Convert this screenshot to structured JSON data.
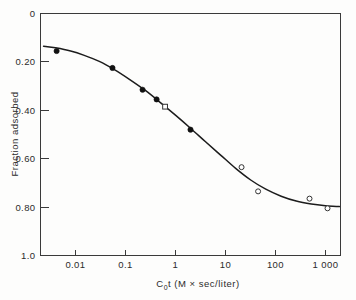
{
  "chart_data": {
    "type": "line",
    "title": "",
    "xlabel": "C₀t (M × sec/liter)",
    "ylabel": "Fraction adsorbed",
    "xscale": "log",
    "yscale": "linear",
    "xlim": [
      0.002,
      2000
    ],
    "ylim": [
      0,
      1.0
    ],
    "y_inverted": true,
    "grid": false,
    "legend": "none",
    "xticks": [
      {
        "value": 0.01,
        "label": "0.01"
      },
      {
        "value": 0.1,
        "label": "0.1"
      },
      {
        "value": 1,
        "label": "1"
      },
      {
        "value": 10,
        "label": "10"
      },
      {
        "value": 100,
        "label": "100"
      },
      {
        "value": 1000,
        "label": "1 000"
      }
    ],
    "yticks": [
      {
        "value": 0,
        "label": "0"
      },
      {
        "value": 0.2,
        "label": "0.20"
      },
      {
        "value": 0.4,
        "label": "0.40"
      },
      {
        "value": 0.6,
        "label": "0.60"
      },
      {
        "value": 0.8,
        "label": "0.80"
      },
      {
        "value": 1.0,
        "label": "1.0"
      }
    ],
    "series": [
      {
        "name": "filled-circles",
        "marker": "filled-circle",
        "x": [
          0.0042,
          0.055,
          0.22,
          0.42,
          2.0
        ],
        "y": [
          0.155,
          0.225,
          0.315,
          0.355,
          0.48
        ]
      },
      {
        "name": "open-square",
        "marker": "open-square",
        "x": [
          0.62
        ],
        "y": [
          0.385
        ]
      },
      {
        "name": "open-circles",
        "marker": "open-circle",
        "x": [
          21,
          45,
          480,
          1100
        ],
        "y": [
          0.635,
          0.735,
          0.765,
          0.805
        ]
      }
    ],
    "fitted_curve": {
      "name": "sigmoid-fit",
      "x": [
        0.0023,
        0.004,
        0.008,
        0.015,
        0.03,
        0.06,
        0.12,
        0.25,
        0.5,
        1.0,
        2.0,
        4.0,
        8.0,
        16,
        32,
        64,
        130,
        260,
        520,
        1000,
        1900
      ],
      "y": [
        0.135,
        0.142,
        0.155,
        0.173,
        0.198,
        0.232,
        0.272,
        0.318,
        0.368,
        0.42,
        0.474,
        0.53,
        0.585,
        0.64,
        0.688,
        0.726,
        0.755,
        0.775,
        0.787,
        0.794,
        0.798
      ]
    }
  },
  "colors": {
    "axis": "#3a3a3a",
    "curve": "#1c1c1c",
    "marker_filled": "#111111",
    "marker_open_stroke": "#333333",
    "background": "#fdfdfc"
  }
}
